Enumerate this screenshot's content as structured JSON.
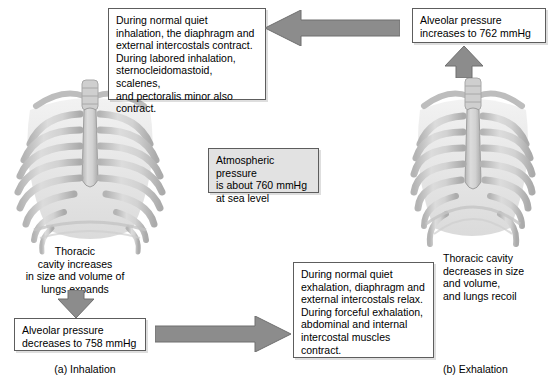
{
  "figure": {
    "background_color": "#ffffff",
    "box_border_color": "#5d5d5d",
    "box_fill_color": "#ffffff",
    "shaded_box_fill_color": "#e2e2e2",
    "arrow_color": "#8c8c8c",
    "arrow_outline_color": "#6f6f6f",
    "bone_color": "#c9c9c9"
  },
  "boxes": {
    "inhalation_muscles": "During normal quiet\ninhalation, the diaphragm and\nexternal intercostals contract.\nDuring labored inhalation,\nsternocleidomastoid, scalenes,\nand pectoralis minor also\ncontract.",
    "alveolar_pressure_increase": "Alveolar pressure\nincreases to 762 mmHg",
    "atmospheric_pressure": "Atmospheric pressure\nis about 760 mmHg\nat sea level",
    "alveolar_pressure_decrease": "Alveolar pressure\ndecreases to 758 mmHg",
    "exhalation_muscles": "During normal quiet\nexhalation, diaphragm and\nexternal intercostals relax.\nDuring forceful exhalation,\nabdominal and internal\nintercostal muscles\ncontract."
  },
  "captions": {
    "thoracic_cavity_increases": "Thoracic\ncavity increases\nin size and volume of\nlungs expands",
    "thoracic_cavity_decreases": "Thoracic cavity\ndecreases in size\nand volume,\nand lungs recoil"
  },
  "panel_labels": {
    "inhalation": "(a) Inhalation",
    "exhalation": "(b) Exhalation"
  },
  "icons": {
    "arrow_left": "arrow-left-icon",
    "arrow_right": "arrow-right-icon",
    "arrow_up": "arrow-up-icon",
    "arrow_down": "arrow-down-icon",
    "ribcage_inhalation": "ribcage-expanded-icon",
    "ribcage_exhalation": "ribcage-recoiled-icon"
  }
}
